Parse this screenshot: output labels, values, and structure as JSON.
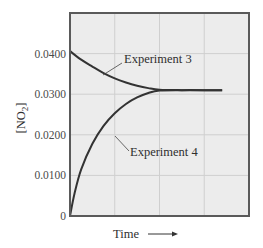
{
  "chart_data": {
    "type": "line",
    "title": "",
    "xlabel": "Time",
    "ylabel": "[NO2]",
    "ylabel_display": {
      "base": "[NO",
      "sub": "2",
      "close": "]"
    },
    "xlabel_arrow": "→",
    "ylim": [
      0,
      0.05
    ],
    "xlim": [
      0,
      4
    ],
    "yticks": [
      0,
      0.01,
      0.02,
      0.03,
      0.04
    ],
    "ytick_labels": [
      "0",
      "0.0100",
      "0.0200",
      "0.0300",
      "0.0400"
    ],
    "x_gridlines": [
      1,
      2,
      3
    ],
    "grid": true,
    "legend": null,
    "equilibrium_value": 0.031,
    "series": [
      {
        "name": "Experiment 3",
        "x": [
          0,
          0.25,
          0.5,
          0.75,
          1.0,
          1.25,
          1.5,
          1.75,
          2.0,
          2.5,
          3.0,
          3.4
        ],
        "y": [
          0.0406,
          0.0385,
          0.0368,
          0.0352,
          0.0339,
          0.0329,
          0.0321,
          0.0315,
          0.0311,
          0.031,
          0.031,
          0.031
        ]
      },
      {
        "name": "Experiment 4",
        "x": [
          0,
          0.1,
          0.25,
          0.5,
          0.75,
          1.0,
          1.25,
          1.5,
          1.75,
          2.0,
          2.5,
          3.0,
          3.4
        ],
        "y": [
          0,
          0.0055,
          0.0115,
          0.0178,
          0.0222,
          0.0253,
          0.0276,
          0.0292,
          0.0303,
          0.0309,
          0.031,
          0.031,
          0.031
        ]
      }
    ],
    "annotations": [
      {
        "text": "Experiment 3",
        "series": "Experiment 3"
      },
      {
        "text": "Experiment 4",
        "series": "Experiment 4"
      }
    ],
    "colors": {
      "background": "#ffffff",
      "plot_area": "#ececec",
      "grid": "#cfcfcf",
      "frame": "#5a5a5a",
      "curve": "#333333"
    }
  }
}
